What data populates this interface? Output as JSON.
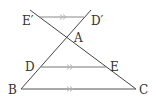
{
  "diagram": {
    "type": "geometry",
    "points": {
      "A": {
        "label": "A",
        "x": 67,
        "y": 38
      },
      "B": {
        "label": "B",
        "x": 21,
        "y": 89
      },
      "C": {
        "label": "C",
        "x": 136,
        "y": 89
      },
      "D": {
        "label": "D",
        "x": 41,
        "y": 67
      },
      "E": {
        "label": "E",
        "x": 106,
        "y": 67
      },
      "D_prime": {
        "label": "D′",
        "x": 84,
        "y": 17
      },
      "E_prime": {
        "label": "E′",
        "x": 39,
        "y": 17
      }
    },
    "segments": [
      "BC",
      "DE",
      "E′D′",
      "BD′",
      "CE′"
    ],
    "parallel_marks": [
      "E′D′",
      "DE",
      "BC"
    ],
    "colors": {
      "line": "#444444",
      "parallel_line": "#8a8a8a",
      "arrow_mark": "#b5b5b5"
    }
  }
}
